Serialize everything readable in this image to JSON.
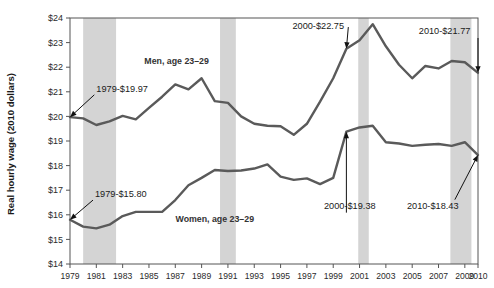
{
  "chart_data": {
    "type": "line",
    "title": "",
    "xlabel": "",
    "ylabel": "Real hourly wage (2010 dollars)",
    "ylim": [
      14,
      24
    ],
    "xlim": [
      1979,
      2010
    ],
    "grid": false,
    "legend": "inline-labels",
    "ytick_labels": [
      "$24",
      "$23",
      "$22",
      "$21",
      "$20",
      "$19",
      "$18",
      "$17",
      "$16",
      "$15",
      "$14"
    ],
    "ytick_values": [
      24,
      23,
      22,
      21,
      20,
      19,
      18,
      17,
      16,
      15,
      14
    ],
    "xtick_labels": [
      "1979",
      "1981",
      "1983",
      "1985",
      "1987",
      "1989",
      "1991",
      "1993",
      "1995",
      "1997",
      "1999",
      "2001",
      "2003",
      "2005",
      "2007",
      "2009",
      "2010"
    ],
    "xtick_values": [
      1979,
      1981,
      1983,
      1985,
      1987,
      1989,
      1991,
      1993,
      1995,
      1997,
      1999,
      2001,
      2003,
      2005,
      2007,
      2009,
      2010
    ],
    "x": [
      1979,
      1980,
      1981,
      1982,
      1983,
      1984,
      1985,
      1986,
      1987,
      1988,
      1989,
      1990,
      1991,
      1992,
      1993,
      1994,
      1995,
      1996,
      1997,
      1998,
      1999,
      2000,
      2001,
      2002,
      2003,
      2004,
      2005,
      2006,
      2007,
      2008,
      2009,
      2010
    ],
    "series": [
      {
        "name": "Men, age 23–29",
        "label": "Men, age 23–29",
        "color": "#5a5a5a",
        "values": [
          19.97,
          19.92,
          19.65,
          19.8,
          20.02,
          19.88,
          20.35,
          20.8,
          21.3,
          21.1,
          21.55,
          20.62,
          20.55,
          20.0,
          19.7,
          19.62,
          19.6,
          19.25,
          19.7,
          20.6,
          21.55,
          22.75,
          23.1,
          23.75,
          22.85,
          22.1,
          21.55,
          22.05,
          21.95,
          22.25,
          22.2,
          21.77
        ]
      },
      {
        "name": "Women, age 23–29",
        "label": "Women, age 23–29",
        "color": "#5a5a5a",
        "values": [
          15.8,
          15.52,
          15.45,
          15.6,
          15.95,
          16.12,
          16.12,
          16.12,
          16.6,
          17.2,
          17.5,
          17.82,
          17.78,
          17.8,
          17.88,
          18.05,
          17.55,
          17.42,
          17.48,
          17.25,
          17.5,
          19.38,
          19.55,
          19.62,
          18.95,
          18.9,
          18.8,
          18.85,
          18.88,
          18.8,
          18.95,
          18.43
        ]
      }
    ],
    "recession_bands": [
      {
        "name": "recession-1980-1982",
        "start": 1980.0,
        "end": 1982.5
      },
      {
        "name": "recession-1990-1991",
        "start": 1990.4,
        "end": 1991.6
      },
      {
        "name": "recession-2001",
        "start": 2000.9,
        "end": 2001.7
      },
      {
        "name": "recession-2008-2009",
        "start": 2007.9,
        "end": 2009.5
      }
    ],
    "annotations": [
      {
        "id": "men-1979",
        "text": "1979-$19.97",
        "x": 1979,
        "y": 19.97,
        "label_x": 1981.0,
        "label_y": 21.0,
        "anchor": "start"
      },
      {
        "id": "men-2000",
        "text": "2000-$22.75",
        "x": 2000,
        "y": 22.75,
        "label_x": 1995.9,
        "label_y": 23.55,
        "anchor": "start"
      },
      {
        "id": "men-2010",
        "text": "2010-$21.77",
        "x": 2010,
        "y": 21.77,
        "label_x": 2005.5,
        "label_y": 23.35,
        "anchor": "start"
      },
      {
        "id": "women-1979",
        "text": "1979-$15.80",
        "x": 1979,
        "y": 15.8,
        "label_x": 1980.9,
        "label_y": 16.72,
        "anchor": "start"
      },
      {
        "id": "women-2000",
        "text": "2000-$19.38",
        "x": 2000,
        "y": 19.38,
        "label_x": 1998.3,
        "label_y": 16.25,
        "anchor": "start"
      },
      {
        "id": "women-2010",
        "text": "2010-$18.43",
        "x": 2010,
        "y": 18.43,
        "label_x": 2004.6,
        "label_y": 16.25,
        "anchor": "start"
      }
    ],
    "series_inline_labels": [
      {
        "id": "men-series-label",
        "text": "Men, age 23–29",
        "x": 1987.1,
        "y": 22.15
      },
      {
        "id": "women-series-label",
        "text": "Women, age 23–29",
        "x": 1990.0,
        "y": 15.72
      }
    ]
  },
  "colors": {
    "band": "#cdcdcd",
    "line": "#5a5a5a",
    "axis": "#555555",
    "text": "#1a1a1a",
    "background": "#ffffff"
  }
}
